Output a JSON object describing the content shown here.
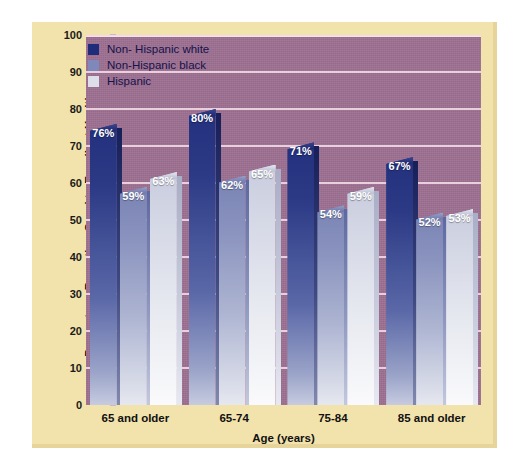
{
  "figure": {
    "panel_color": "#f2e2ac",
    "plot_background": "#9c6e90",
    "gridline_color": "#f0d8e4"
  },
  "chart_data": {
    "type": "bar",
    "title": "",
    "subtitle": "",
    "xlabel": "Age (years)",
    "ylabel": "Percentage Reporting Good to Excellent Health",
    "categories": [
      "65 and older",
      "65-74",
      "75-84",
      "85 and older"
    ],
    "series": [
      {
        "name": "Non- Hispanic white",
        "color": "#1f2c7a",
        "values": [
          76,
          80,
          71,
          67
        ],
        "labels": [
          "76%",
          "80%",
          "71%",
          "67%"
        ]
      },
      {
        "name": "Non-Hispanic black",
        "color": "#7e88ba",
        "values": [
          59,
          62,
          54,
          52
        ],
        "labels": [
          "59%",
          "62%",
          "54%",
          "52%"
        ]
      },
      {
        "name": "Hispanic",
        "color": "#dcdfea",
        "values": [
          63,
          65,
          59,
          53
        ],
        "labels": [
          "63%",
          "65%",
          "59%",
          "53%"
        ]
      }
    ],
    "ylim": [
      0,
      100
    ],
    "yticks": [
      0,
      10,
      20,
      30,
      40,
      50,
      60,
      70,
      80,
      90,
      100
    ],
    "ytick_labels": [
      "0",
      "10",
      "20",
      "30",
      "40",
      "50",
      "60",
      "70",
      "80",
      "90",
      "100"
    ],
    "grid": true,
    "grid_axis": "y",
    "legend_position": "top-left",
    "value_labels": true,
    "bar_style": "3d-beveled-gradient"
  }
}
